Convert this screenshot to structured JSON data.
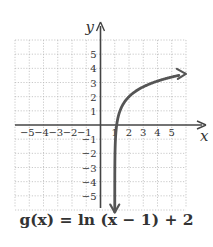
{
  "chart_data": {
    "type": "line",
    "title": "",
    "function_label": "g(x) = ln (x − 1) + 2",
    "xlabel": "x",
    "ylabel": "y",
    "xlim": [
      -6,
      6
    ],
    "ylim": [
      -6,
      6
    ],
    "grid": true,
    "x_ticks": [
      -5,
      -4,
      -3,
      -2,
      -1,
      1,
      2,
      3,
      4,
      5
    ],
    "y_ticks": [
      -5,
      -4,
      -3,
      -2,
      -1,
      1,
      2,
      3,
      4,
      5
    ],
    "vertical_asymptote": 1,
    "series": [
      {
        "name": "g(x) = ln(x − 1) + 2",
        "x": [
          1.0025,
          1.01,
          1.05,
          1.1,
          1.135,
          1.25,
          1.5,
          2,
          2.5,
          3,
          3.5,
          4,
          4.5,
          5,
          5.5,
          6
        ],
        "values": [
          -4.0,
          -2.61,
          -1.0,
          -0.3,
          0.0,
          0.61,
          1.31,
          2.0,
          2.41,
          2.69,
          2.92,
          3.1,
          3.25,
          3.39,
          3.5,
          3.61
        ]
      }
    ],
    "annotations": [
      "arrow at lower end pointing down toward asymptote x = 1",
      "arrow at upper right end"
    ]
  },
  "labels": {
    "x_axis": "x",
    "y_axis": "y",
    "caption": "g(x) = ln (x − 1) + 2"
  },
  "colors": {
    "curve": "#555555",
    "axes": "#444444",
    "grid": "#bbbbbb",
    "text": "#333333"
  }
}
